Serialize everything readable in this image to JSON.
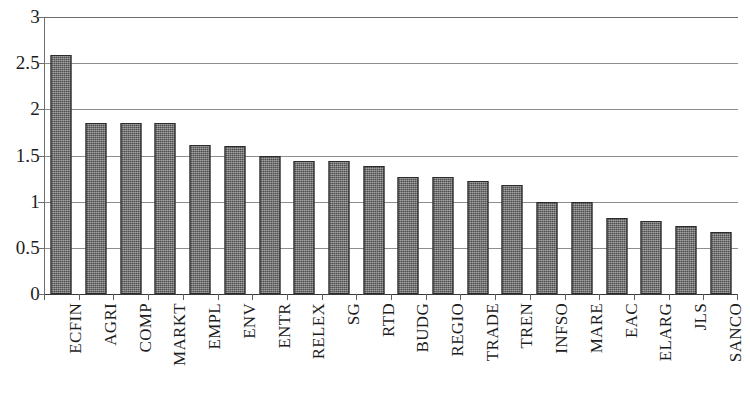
{
  "chart_data": {
    "type": "bar",
    "title": "",
    "subtitle": "",
    "xlabel": "",
    "ylabel": "",
    "ylim": [
      0,
      3
    ],
    "y_ticks": [
      "0",
      "0.5",
      "1",
      "1.5",
      "2",
      "2.5",
      "3"
    ],
    "y_tick_values": [
      0,
      0.5,
      1,
      1.5,
      2,
      2.5,
      3
    ],
    "grid": "horizontal",
    "legend": "none",
    "bar_color": "#4e4e4e",
    "categories": [
      "ECFIN",
      "AGRI",
      "COMP",
      "MARKT",
      "EMPL",
      "ENV",
      "ENTR",
      "RELEX",
      "SG",
      "RTD",
      "BUDG",
      "REGIO",
      "TRADE",
      "TREN",
      "INFSO",
      "MARE",
      "EAC",
      "ELARG",
      "JLS",
      "SANCO"
    ],
    "values": [
      2.59,
      1.85,
      1.85,
      1.85,
      1.61,
      1.6,
      1.49,
      1.44,
      1.44,
      1.39,
      1.27,
      1.27,
      1.22,
      1.18,
      1.0,
      1.0,
      0.82,
      0.79,
      0.74,
      0.67
    ],
    "series": [
      {
        "name": "",
        "values": [
          2.59,
          1.85,
          1.85,
          1.85,
          1.61,
          1.6,
          1.49,
          1.44,
          1.44,
          1.39,
          1.27,
          1.27,
          1.22,
          1.18,
          1.0,
          1.0,
          0.82,
          0.79,
          0.74,
          0.67
        ]
      }
    ]
  }
}
